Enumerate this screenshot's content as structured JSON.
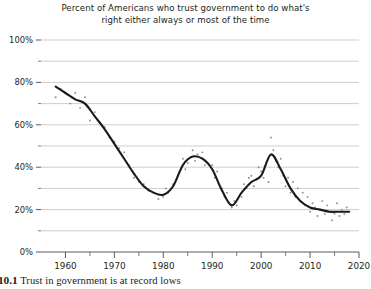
{
  "figure": {
    "title_lines": [
      "Percent of Americans who trust government to do what's",
      "right either always or most of the time"
    ],
    "caption_number": "10.1",
    "caption_text": "Trust in government is at record lows"
  },
  "style": {
    "line_color": "#1a1a1a",
    "point_color": "#8c8c8c",
    "grid_color": "#b9b9b9",
    "axis_color": "#5a5a5a",
    "background": "#ffffff"
  },
  "chart_data": {
    "type": "line",
    "title": "Percent of Americans who trust government to do what's right either always or most of the time",
    "xlabel": "",
    "ylabel": "",
    "xlim": [
      1955,
      2020
    ],
    "ylim": [
      0,
      100
    ],
    "grid": true,
    "legend": "none",
    "y_major_ticks": [
      0,
      20,
      40,
      60,
      80,
      100
    ],
    "y_major_tick_labels": [
      "0%",
      "20%",
      "40%",
      "60%",
      "80%",
      "100%"
    ],
    "y_minor_ticks": [
      10,
      30,
      50,
      70,
      90
    ],
    "x_major_ticks": [
      1960,
      1970,
      1980,
      1990,
      2000,
      2010,
      2020
    ],
    "x_major_tick_labels": [
      "1960",
      "1970",
      "1980",
      "1990",
      "2000",
      "2010",
      "2020"
    ],
    "x_minor_ticks": [
      1965,
      1975,
      1985,
      1995,
      2005,
      2015
    ],
    "series": [
      {
        "name": "Trust in government (smoothed trend)",
        "type": "line",
        "x": [
          1958,
          1960,
          1962,
          1964,
          1966,
          1968,
          1970,
          1972,
          1974,
          1976,
          1978,
          1980,
          1982,
          1984,
          1986,
          1988,
          1990,
          1992,
          1994,
          1996,
          1998,
          2000,
          2002,
          2004,
          2006,
          2008,
          2010,
          2012,
          2014,
          2016,
          2018
        ],
        "y": [
          78,
          75,
          72,
          70,
          64,
          58,
          51,
          44,
          37,
          31,
          28,
          27,
          31,
          41,
          45,
          44,
          39,
          29,
          22,
          28,
          33,
          36,
          46,
          39,
          30,
          24,
          21,
          20,
          19,
          19,
          19
        ]
      },
      {
        "name": "Survey observations",
        "type": "scatter",
        "x": [
          1958,
          1959,
          1961,
          1962,
          1963,
          1964,
          1965,
          1966,
          1967,
          1968,
          1969,
          1970,
          1971,
          1972,
          1973,
          1974,
          1975,
          1976,
          1977,
          1978,
          1979,
          1980,
          1980.5,
          1981,
          1982,
          1983,
          1984,
          1984.5,
          1985,
          1986,
          1986.5,
          1987,
          1988,
          1988.5,
          1989,
          1990,
          1990.5,
          1991,
          1992,
          1992.5,
          1993,
          1994,
          1994.5,
          1995,
          1996,
          1996.5,
          1997,
          1997.5,
          1998,
          1998.5,
          1999,
          1999.5,
          2000,
          2000.5,
          2001,
          2001.5,
          2002,
          2002.5,
          2003,
          2003.5,
          2004,
          2004.5,
          2005,
          2005.5,
          2006,
          2006.5,
          2007,
          2007.5,
          2008,
          2008.5,
          2009,
          2009.5,
          2010,
          2010.5,
          2011,
          2011.5,
          2012,
          2012.5,
          2013,
          2013.5,
          2014,
          2014.5,
          2015,
          2015.5,
          2016,
          2016.5,
          2017,
          2017.5
        ],
        "y": [
          73,
          77,
          70,
          75,
          68,
          73,
          62,
          66,
          61,
          59,
          54,
          52,
          49,
          47,
          41,
          35,
          33,
          32,
          29,
          28,
          25,
          26,
          30,
          28,
          32,
          36,
          44,
          39,
          42,
          48,
          43,
          46,
          47,
          41,
          42,
          41,
          35,
          38,
          30,
          26,
          28,
          21,
          24,
          22,
          26,
          32,
          30,
          35,
          36,
          31,
          34,
          40,
          38,
          35,
          42,
          33,
          54,
          48,
          43,
          40,
          44,
          36,
          31,
          35,
          28,
          33,
          26,
          30,
          24,
          28,
          22,
          26,
          19,
          23,
          21,
          17,
          20,
          24,
          18,
          22,
          19,
          15,
          18,
          23,
          17,
          20,
          18,
          21
        ]
      }
    ]
  }
}
